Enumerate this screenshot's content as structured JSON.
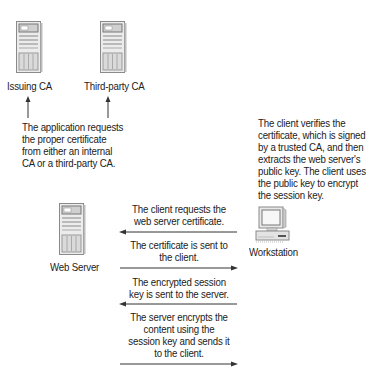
{
  "nodes": {
    "issuing_ca": {
      "label": "Issuing CA",
      "icon": "server-tower-icon"
    },
    "third_party_ca": {
      "label": "Third-party CA",
      "icon": "server-tower-icon"
    },
    "web_server": {
      "label": "Web Server",
      "icon": "server-tower-icon"
    },
    "workstation": {
      "label": "Workstation",
      "icon": "desktop-computer-icon"
    }
  },
  "notes": {
    "ca_request": "The application requests\nthe proper certificate\nfrom either an internal\nCA or a third-party CA.",
    "client_verify": "The client verifies the\ncertificate, which is signed\nby a trusted CA, and then\nextracts the web server's\npublic key. The client uses\nthe public key to encrypt\nthe session key."
  },
  "messages": [
    {
      "text": "The client requests the\nweb server certificate.",
      "direction": "to-server"
    },
    {
      "text": "The certificate is sent to\nthe client.",
      "direction": "to-client"
    },
    {
      "text": "The encrypted session\nkey is sent to the server.",
      "direction": "to-server"
    },
    {
      "text": "The server encrypts the\ncontent using the\nsession key and sends it\nto the client.",
      "direction": "to-client"
    }
  ],
  "colors": {
    "line": "#333333",
    "text": "#222222",
    "icon_fill": "#e6e6e6",
    "icon_stroke": "#8a8a8a"
  }
}
